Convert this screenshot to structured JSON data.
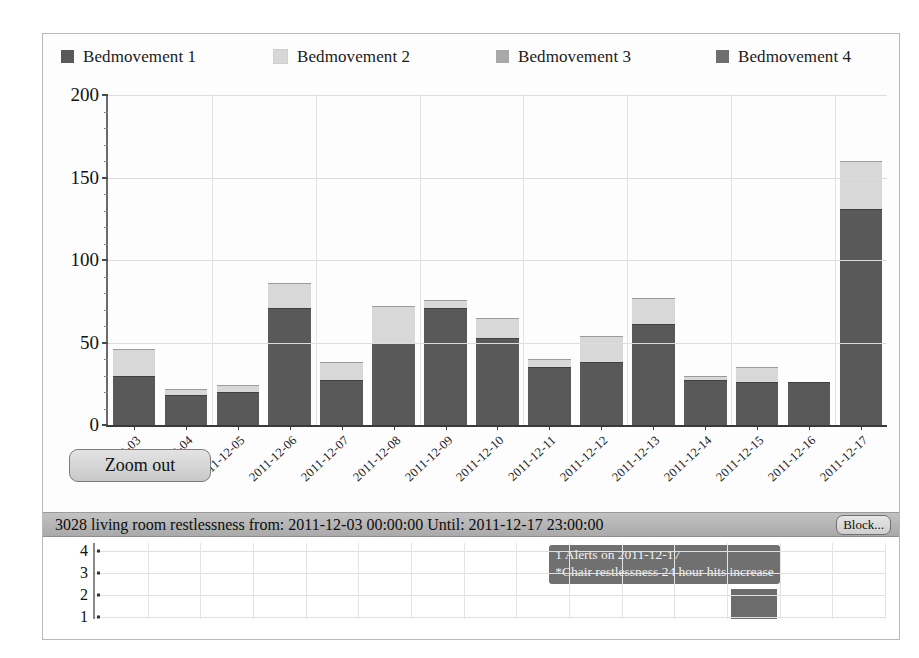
{
  "legend": {
    "items": [
      {
        "label": "Bedmovement 1",
        "color": "#595959",
        "icon": "legend-swatch-icon"
      },
      {
        "label": "Bedmovement 2",
        "color": "#d8d8d8",
        "icon": "legend-swatch-icon"
      },
      {
        "label": "Bedmovement 3",
        "color": "#a8a8a8",
        "icon": "legend-swatch-icon"
      },
      {
        "label": "Bedmovement 4",
        "color": "#6e6e6e",
        "icon": "legend-swatch-icon"
      }
    ]
  },
  "controls": {
    "zoom_out_label": "Zoom out",
    "block_label": "Block..."
  },
  "statusbar": {
    "text": "3028 living room restlessness from: 2011-12-03 00:00:00 Until: 2011-12-17 23:00:00"
  },
  "lower_panel": {
    "y_labels": [
      "4",
      "3",
      "2",
      "1"
    ],
    "tooltip_line1": "1 Alerts on 2011-12-17",
    "tooltip_line2": "*Chair restlessness 24 hour hits increase"
  },
  "chart_data": {
    "type": "bar",
    "stacked": true,
    "title": "",
    "xlabel": "",
    "ylabel": "",
    "ylim": [
      0,
      200
    ],
    "yticks": [
      0,
      50,
      100,
      150,
      200
    ],
    "ytick_labels": [
      "0",
      "50",
      "100",
      "150",
      "200"
    ],
    "grid": true,
    "legend_position": "top",
    "categories": [
      "2011-12-03",
      "2011-12-04",
      "2011-12-05",
      "2011-12-06",
      "2011-12-07",
      "2011-12-08",
      "2011-12-09",
      "2011-12-10",
      "2011-12-11",
      "2011-12-12",
      "2011-12-13",
      "2011-12-14",
      "2011-12-15",
      "2011-12-16",
      "2011-12-17"
    ],
    "series": [
      {
        "name": "Bedmovement 1",
        "color": "#595959",
        "values": [
          30,
          18,
          20,
          71,
          27,
          50,
          71,
          53,
          35,
          38,
          61,
          27,
          26,
          26,
          131
        ]
      },
      {
        "name": "Bedmovement 2",
        "color": "#d8d8d8",
        "values": [
          16,
          4,
          4,
          15,
          11,
          22,
          5,
          12,
          5,
          16,
          16,
          3,
          9,
          0,
          29
        ]
      },
      {
        "name": "Bedmovement 3",
        "color": "#a8a8a8",
        "values": [
          0,
          0,
          0,
          0,
          0,
          0,
          0,
          0,
          0,
          0,
          0,
          0,
          0,
          0,
          0
        ]
      },
      {
        "name": "Bedmovement 4",
        "color": "#6e6e6e",
        "values": [
          0,
          0,
          0,
          0,
          0,
          0,
          0,
          0,
          0,
          0,
          0,
          0,
          0,
          0,
          0
        ]
      }
    ],
    "totals": [
      46,
      22,
      24,
      86,
      38,
      72,
      76,
      65,
      40,
      54,
      77,
      30,
      35,
      26,
      160
    ]
  }
}
